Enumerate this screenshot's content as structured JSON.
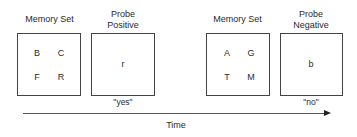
{
  "panels": [
    {
      "title": "Memory Set",
      "letters": [
        "B",
        "C",
        "F",
        "R"
      ]
    },
    {
      "title_line1": "Probe",
      "title_line2": "Positive",
      "probe": "r",
      "response": "\"yes\""
    },
    {
      "title": "Memory Set",
      "letters": [
        "A",
        "G",
        "T",
        "M"
      ]
    },
    {
      "title_line1": "Probe",
      "title_line2": "Negative",
      "probe": "b",
      "response": "\"no\""
    }
  ],
  "axis": {
    "label": "Time"
  }
}
